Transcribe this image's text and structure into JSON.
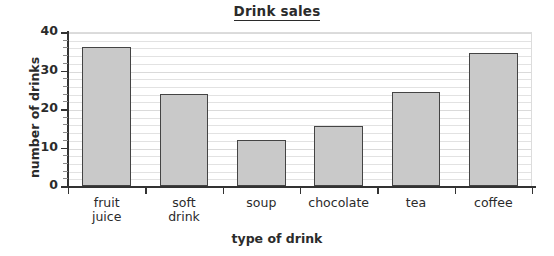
{
  "chart_data": {
    "type": "bar",
    "title": "Drink sales",
    "xlabel": "type of drink",
    "ylabel": "number of drinks",
    "categories": [
      "fruit\njuice",
      "soft\ndrink",
      "soup",
      "chocolate",
      "tea",
      "coffee"
    ],
    "values": [
      36,
      24,
      12,
      15.5,
      24.5,
      34.5
    ],
    "ylim": [
      0,
      40
    ],
    "ytick_labels": [
      "0",
      "10",
      "20",
      "30",
      "40"
    ],
    "ytick_values": [
      0,
      10,
      20,
      30,
      40
    ],
    "minor_tick_step": 2,
    "grid": true,
    "grid_axis": "y",
    "legend": null,
    "bar_fill_color": "#c9c9c9",
    "bar_edge_color": "#444444",
    "axis_color": "#333333",
    "grid_color": "#e2e2e2",
    "text_color": "#2b2b2b",
    "background_color": "#ffffff",
    "title_underlined": true
  }
}
